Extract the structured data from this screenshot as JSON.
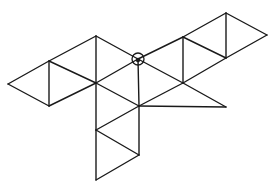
{
  "diagram": {
    "title": "",
    "stroke_color": "#1a1a1a",
    "background": "#ffffff",
    "vertices": {
      "A": [
        8,
        84
      ],
      "B": [
        49,
        61
      ],
      "C": [
        49,
        106
      ],
      "D": [
        96,
        36
      ],
      "E": [
        96,
        83
      ],
      "F": [
        138,
        59
      ],
      "G": [
        183,
        37
      ],
      "H": [
        226,
        13
      ],
      "I": [
        226,
        58
      ],
      "J": [
        267,
        35
      ],
      "K": [
        183,
        83
      ],
      "L": [
        139,
        106
      ],
      "M": [
        226,
        107
      ],
      "N": [
        96,
        130
      ],
      "O": [
        139,
        155
      ],
      "P": [
        96,
        180
      ]
    },
    "edges": [
      [
        "A",
        "B"
      ],
      [
        "A",
        "C"
      ],
      [
        "B",
        "C"
      ],
      [
        "B",
        "D"
      ],
      [
        "B",
        "E"
      ],
      [
        "C",
        "E"
      ],
      [
        "D",
        "E"
      ],
      [
        "D",
        "F"
      ],
      [
        "E",
        "F"
      ],
      [
        "F",
        "G"
      ],
      [
        "F",
        "K"
      ],
      [
        "G",
        "K"
      ],
      [
        "G",
        "H"
      ],
      [
        "G",
        "I"
      ],
      [
        "H",
        "I"
      ],
      [
        "H",
        "J"
      ],
      [
        "I",
        "J"
      ],
      [
        "I",
        "K"
      ],
      [
        "K",
        "M"
      ],
      [
        "L",
        "M"
      ],
      [
        "E",
        "L"
      ],
      [
        "F",
        "L"
      ],
      [
        "K",
        "L"
      ],
      [
        "L",
        "N"
      ],
      [
        "N",
        "O"
      ],
      [
        "L",
        "O"
      ],
      [
        "N",
        "P"
      ],
      [
        "O",
        "P"
      ],
      [
        "E",
        "N"
      ]
    ],
    "marked_vertex": {
      "id": "F",
      "marker": "circle-with-dot",
      "radius": 6
    }
  }
}
